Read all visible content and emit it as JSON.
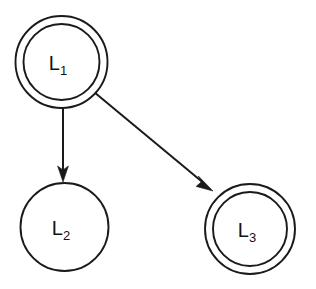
{
  "diagram": {
    "background_color": "#ffffff",
    "stroke_color": "#1a1a1a",
    "nodes": [
      {
        "id": "L1",
        "label_base": "L",
        "label_sub": "1",
        "shape": "double-circle",
        "accepting": true,
        "cx": 61.5,
        "cy": 62,
        "r_outer": 46,
        "r_inner": 38
      },
      {
        "id": "L2",
        "label_base": "L",
        "label_sub": "2",
        "shape": "circle",
        "accepting": false,
        "cx": 64.5,
        "cy": 227,
        "r_outer": 44,
        "r_inner": 0
      },
      {
        "id": "L3",
        "label_base": "L",
        "label_sub": "3",
        "shape": "double-circle",
        "accepting": true,
        "cx": 250,
        "cy": 229,
        "r_outer": 45,
        "r_inner": 37
      }
    ],
    "edges": [
      {
        "id": "L1-to-L2",
        "from": "L1",
        "to": "L2",
        "label": "",
        "directed": true,
        "x1": 63,
        "y1": 108,
        "x2": 63,
        "y2": 182
      },
      {
        "id": "L1-to-L3",
        "from": "L1",
        "to": "L3",
        "label": "",
        "directed": true,
        "x1": 94,
        "y1": 92,
        "x2": 213,
        "y2": 191
      }
    ]
  }
}
